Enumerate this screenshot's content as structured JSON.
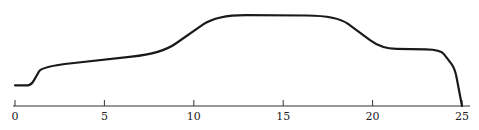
{
  "chart_data": {
    "type": "line",
    "title": "",
    "xlabel": "",
    "ylabel": "",
    "xlim": [
      0,
      25
    ],
    "grid": false,
    "legend": null,
    "x_ticks": [
      "0",
      "5",
      "10",
      "15",
      "20",
      "25"
    ],
    "series": [
      {
        "name": "profile",
        "color": "#1a1a1a",
        "points": [
          {
            "x": 0.0,
            "y": 0.22
          },
          {
            "x": 0.9,
            "y": 0.22
          },
          {
            "x": 1.5,
            "y": 0.42
          },
          {
            "x": 8.2,
            "y": 0.56
          },
          {
            "x": 11.3,
            "y": 0.97
          },
          {
            "x": 18.0,
            "y": 0.96
          },
          {
            "x": 20.5,
            "y": 0.61
          },
          {
            "x": 23.8,
            "y": 0.6
          },
          {
            "x": 24.6,
            "y": 0.4
          },
          {
            "x": 25.0,
            "y": 0.0
          }
        ]
      }
    ]
  }
}
